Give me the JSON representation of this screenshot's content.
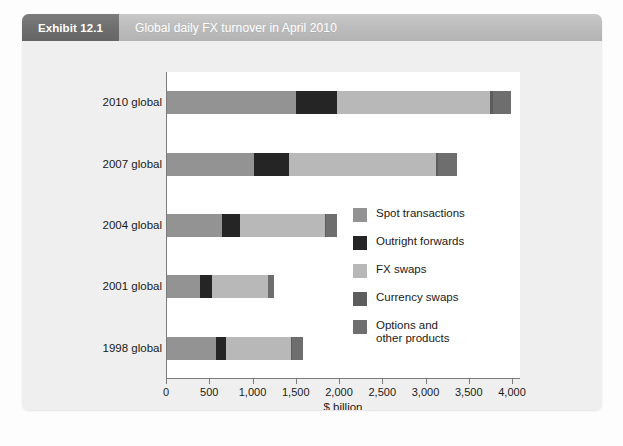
{
  "header": {
    "exhibit_tag": "Exhibit 12.1",
    "title": "Global daily FX turnover in April 2010"
  },
  "colors": {
    "spot_transactions": "#939393",
    "outright_forwards": "#252525",
    "fx_swaps": "#b8b8b8",
    "currency_swaps": "#5d5d5d",
    "options_and_other": "#6e6e6e",
    "tag_background": "#6f6f6f",
    "band_background": "#bdbdbd",
    "panel_background": "#efefef",
    "plot_background": "#ffffff",
    "axis_line": "#7b7b7b"
  },
  "chart_data": {
    "type": "bar",
    "orientation": "horizontal",
    "stacked": true,
    "title": "Global daily FX turnover in April 2010",
    "xlabel": "$ billion",
    "ylabel": "",
    "xlim": [
      0,
      4000
    ],
    "xticks": [
      0,
      500,
      1000,
      1500,
      2000,
      2500,
      3000,
      3500,
      4000
    ],
    "xtick_labels": [
      "0",
      "500",
      "1,000",
      "1,500",
      "2,000",
      "2,500",
      "3,000",
      "3,500",
      "4,000"
    ],
    "categories": [
      "2010 global",
      "2007 global",
      "2004 global",
      "2001 global",
      "1998 global"
    ],
    "grid": false,
    "legend_position": "inside-right",
    "series": [
      {
        "name": "Spot transactions",
        "color": "#939393",
        "values": [
          1490,
          1005,
          631,
          387,
          568
        ]
      },
      {
        "name": "Outright forwards",
        "color": "#252525",
        "values": [
          475,
          400,
          209,
          131,
          116
        ]
      },
      {
        "name": "FX swaps",
        "color": "#b8b8b8",
        "values": [
          1765,
          1700,
          983,
          647,
          751
        ]
      },
      {
        "name": "Currency swaps",
        "color": "#5d5d5d",
        "values": [
          43,
          32,
          21,
          7,
          10
        ]
      },
      {
        "name": "Options and\nother products",
        "color": "#6e6e6e",
        "values": [
          207,
          212,
          119,
          60,
          130
        ]
      }
    ],
    "totals": [
      3980,
      3349,
      1963,
      1232,
      1575
    ]
  },
  "legend": {
    "items": [
      {
        "label": "Spot transactions"
      },
      {
        "label": "Outright forwards"
      },
      {
        "label": "FX swaps"
      },
      {
        "label": " Currency swaps"
      },
      {
        "label": "Options and\nother products"
      }
    ]
  }
}
